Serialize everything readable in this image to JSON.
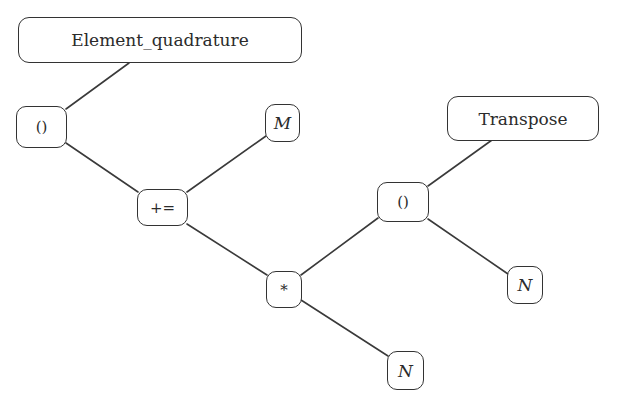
{
  "diagram": {
    "type": "expression-tree",
    "nodes": [
      {
        "id": "element_quadrature",
        "label": "Element_quadrature",
        "kind": "function",
        "x": 18,
        "y": 17,
        "w": 284,
        "h": 46
      },
      {
        "id": "call_1",
        "label": "()",
        "kind": "operator",
        "x": 16,
        "y": 106,
        "w": 51,
        "h": 42
      },
      {
        "id": "M",
        "label": "M",
        "kind": "variable",
        "x": 265,
        "y": 104,
        "w": 35,
        "h": 38
      },
      {
        "id": "plus_assign",
        "label": "+=",
        "kind": "operator",
        "x": 137,
        "y": 189,
        "w": 51,
        "h": 37
      },
      {
        "id": "transpose",
        "label": "Transpose",
        "kind": "function",
        "x": 447,
        "y": 96,
        "w": 152,
        "h": 45
      },
      {
        "id": "call_2",
        "label": "()",
        "kind": "operator",
        "x": 377,
        "y": 182,
        "w": 52,
        "h": 40
      },
      {
        "id": "multiply",
        "label": "*",
        "kind": "operator",
        "x": 266,
        "y": 271,
        "w": 36,
        "h": 37
      },
      {
        "id": "N_right",
        "label": "N",
        "kind": "variable",
        "x": 507,
        "y": 266,
        "w": 36,
        "h": 38
      },
      {
        "id": "N_bottom",
        "label": "N",
        "kind": "variable",
        "x": 387,
        "y": 351,
        "w": 37,
        "h": 39
      }
    ],
    "edges": [
      {
        "from": "element_quadrature",
        "to": "call_1",
        "x1": 129,
        "y1": 63,
        "x2": 66,
        "y2": 109
      },
      {
        "from": "call_1",
        "to": "plus_assign",
        "x1": 66,
        "y1": 143,
        "x2": 138,
        "y2": 192
      },
      {
        "from": "M",
        "to": "plus_assign",
        "x1": 266,
        "y1": 136,
        "x2": 187,
        "y2": 192
      },
      {
        "from": "plus_assign",
        "to": "multiply",
        "x1": 187,
        "y1": 224,
        "x2": 267,
        "y2": 275
      },
      {
        "from": "transpose",
        "to": "call_2",
        "x1": 492,
        "y1": 140,
        "x2": 428,
        "y2": 186
      },
      {
        "from": "multiply",
        "to": "call_2",
        "x1": 301,
        "y1": 275,
        "x2": 378,
        "y2": 218
      },
      {
        "from": "call_2",
        "to": "N_right",
        "x1": 428,
        "y1": 219,
        "x2": 508,
        "y2": 274
      },
      {
        "from": "multiply",
        "to": "N_bottom",
        "x1": 301,
        "y1": 300,
        "x2": 388,
        "y2": 356
      }
    ]
  },
  "labels": {
    "element_quadrature": "Element_quadrature",
    "call_1": "()",
    "M": "M",
    "plus_assign": "+=",
    "transpose": "Transpose",
    "call_2": "()",
    "multiply": "*",
    "N_right": "N",
    "N_bottom": "N"
  }
}
